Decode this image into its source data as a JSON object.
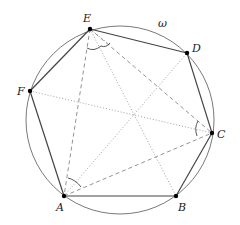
{
  "diagram": {
    "circle": {
      "label": "ω",
      "cx": 120,
      "cy": 120,
      "r": 94
    },
    "points": [
      {
        "name": "A",
        "x": 64,
        "y": 196,
        "lx": 56,
        "ly": 211
      },
      {
        "name": "B",
        "x": 176,
        "y": 196,
        "lx": 178,
        "ly": 211
      },
      {
        "name": "C",
        "x": 212,
        "y": 133,
        "lx": 217,
        "ly": 138
      },
      {
        "name": "D",
        "x": 187,
        "y": 53,
        "lx": 192,
        "ly": 52
      },
      {
        "name": "E",
        "x": 90,
        "y": 29,
        "lx": 83,
        "ly": 22
      },
      {
        "name": "F",
        "x": 30,
        "y": 91,
        "lx": 17,
        "ly": 95
      }
    ],
    "omega_label": {
      "text": "ω",
      "x": 158,
      "y": 27
    },
    "hexagon_sides": [
      "AB",
      "BC",
      "CD",
      "DE",
      "EF",
      "FA"
    ],
    "dashed_segments": [
      "EA",
      "EC",
      "AC"
    ],
    "dotted_segments": [
      "AD",
      "EB",
      "FC"
    ],
    "angle_marks": [
      "at E (AEC)",
      "at A (EAC)",
      "at C (ACE)"
    ]
  }
}
